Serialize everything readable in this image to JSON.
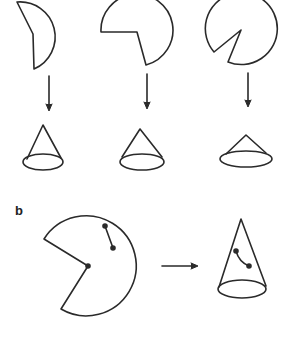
{
  "figure": {
    "panel_b_label": "b",
    "stroke_color": "#2a2a2a",
    "background": "#ffffff"
  },
  "panel_a": {
    "description": "Three circular sectors with increasing removed wedges, each folded into a cone (arrow down); larger removed wedge gives taller, narrower cone",
    "columns": [
      {
        "sector": "semicircle-like sector (large wedge removed)",
        "cone": "tall narrow cone"
      },
      {
        "sector": "three-quarter sector (quarter wedge removed)",
        "cone": "medium cone"
      },
      {
        "sector": "nearly full disc (small wedge removed)",
        "cone": "short wide cone"
      }
    ]
  },
  "panel_b": {
    "description": "Sector with a marked geodesic segment between two points, folded into a cone where the segment becomes a curve on the cone surface"
  }
}
